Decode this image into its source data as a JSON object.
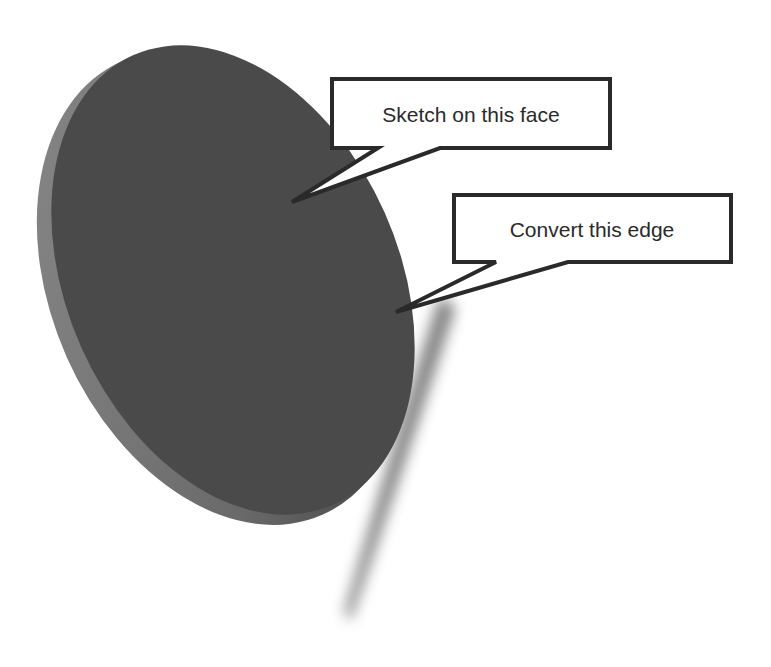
{
  "diagram": {
    "colors": {
      "background": "#ffffff",
      "disk_face": "#4a4a4a",
      "disk_rim": "#7a7a7a",
      "shadow": "#6e6e6e",
      "callout_border": "#2a2a2a",
      "callout_fill": "#ffffff",
      "text": "#2a2a2a"
    },
    "callouts": [
      {
        "id": "face",
        "label": "Sketch on this face"
      },
      {
        "id": "edge",
        "label": "Convert this edge"
      }
    ]
  }
}
